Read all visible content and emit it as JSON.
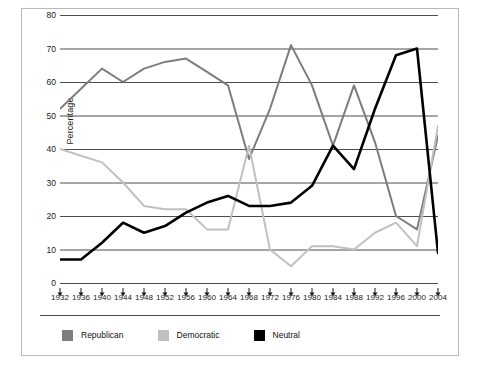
{
  "chart_data": {
    "type": "line",
    "title": "",
    "xlabel": "",
    "ylabel": "Percentage",
    "ylim": [
      0,
      80
    ],
    "ytick_step": 10,
    "yticks": [
      0,
      10,
      20,
      30,
      40,
      50,
      60,
      70,
      80
    ],
    "grid": "horizontal",
    "legend_position": "bottom-left",
    "categories": [
      "1932",
      "1936",
      "1940",
      "1944",
      "1948",
      "1952",
      "1956",
      "1960",
      "1964",
      "1968",
      "1972",
      "1976",
      "1980",
      "1984",
      "1988",
      "1992",
      "1996",
      "2000",
      "2004"
    ],
    "series": [
      {
        "name": "Republican",
        "color": "#7d7d7d",
        "values": [
          52,
          58,
          64,
          60,
          64,
          66,
          67,
          63,
          59,
          37,
          52,
          71,
          59,
          41,
          59,
          42,
          20,
          16,
          44
        ]
      },
      {
        "name": "Democratic",
        "color": "#c0c0c0",
        "values": [
          40,
          38,
          36,
          30,
          23,
          22,
          22,
          16,
          16,
          41,
          10,
          5,
          11,
          11,
          10,
          15,
          18,
          11,
          47
        ]
      },
      {
        "name": "Neutral",
        "color": "#000000",
        "values": [
          7,
          7,
          12,
          18,
          15,
          17,
          21,
          24,
          26,
          23,
          23,
          24,
          29,
          41,
          34,
          52,
          68,
          70,
          9
        ]
      }
    ]
  },
  "legend": {
    "items": [
      {
        "label": "Republican",
        "color": "#7d7d7d"
      },
      {
        "label": "Democratic",
        "color": "#c0c0c0"
      },
      {
        "label": "Neutral",
        "color": "#000000"
      }
    ]
  },
  "style": {
    "grid_color": "#4d4d4d",
    "frame_color": "#b9b9b9",
    "text_color": "#1a1a1a"
  }
}
